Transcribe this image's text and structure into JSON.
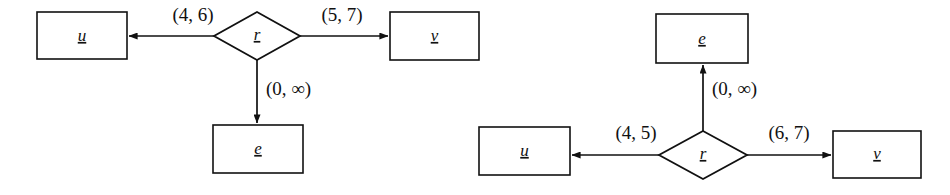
{
  "figure": {
    "type": "entity-relationship-diagram-pair",
    "background_color": "#ffffff",
    "stroke_color": "#111111"
  },
  "diagrams": [
    {
      "id": "left",
      "name": "left-er-diagram",
      "relationship": {
        "label": "r",
        "shape": "diamond"
      },
      "entities": [
        {
          "id": "u",
          "label": "u",
          "shape": "rectangle",
          "position": "left"
        },
        {
          "id": "v",
          "label": "v",
          "shape": "rectangle",
          "position": "right"
        },
        {
          "id": "e",
          "label": "e",
          "shape": "rectangle",
          "position": "below"
        }
      ],
      "edges": [
        {
          "from": "r",
          "to": "u",
          "label": "(4, 6)",
          "min": "4",
          "max": "6",
          "direction": "left"
        },
        {
          "from": "r",
          "to": "v",
          "label": "(5, 7)",
          "min": "5",
          "max": "7",
          "direction": "right"
        },
        {
          "from": "r",
          "to": "e",
          "label": "(0, ∞)",
          "min": "0",
          "max": "∞",
          "direction": "down"
        }
      ]
    },
    {
      "id": "right",
      "name": "right-er-diagram",
      "relationship": {
        "label": "r",
        "shape": "diamond"
      },
      "entities": [
        {
          "id": "e",
          "label": "e",
          "shape": "rectangle",
          "position": "above"
        },
        {
          "id": "u",
          "label": "u",
          "shape": "rectangle",
          "position": "left"
        },
        {
          "id": "v",
          "label": "v",
          "shape": "rectangle",
          "position": "right"
        }
      ],
      "edges": [
        {
          "from": "r",
          "to": "e",
          "label": "(0, ∞)",
          "min": "0",
          "max": "∞",
          "direction": "up"
        },
        {
          "from": "r",
          "to": "u",
          "label": "(4, 5)",
          "min": "4",
          "max": "5",
          "direction": "left"
        },
        {
          "from": "r",
          "to": "v",
          "label": "(6, 7)",
          "min": "6",
          "max": "7",
          "direction": "right"
        }
      ]
    }
  ]
}
